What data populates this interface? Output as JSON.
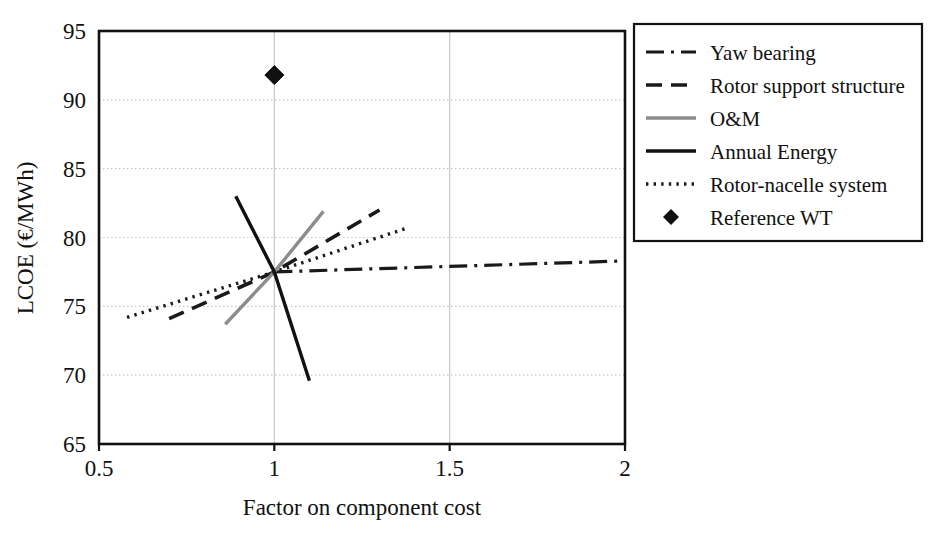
{
  "chart_data": {
    "type": "line",
    "title": "",
    "xlabel": "Factor on component cost",
    "ylabel": "LCOE (€/MWh)",
    "xlim": [
      0.5,
      2.0
    ],
    "ylim": [
      65,
      95
    ],
    "xticks": [
      "0.5",
      "1",
      "1.5",
      "2"
    ],
    "xtick_values": [
      0.5,
      1.0,
      1.5,
      2.0
    ],
    "yticks": [
      "65",
      "70",
      "75",
      "80",
      "85",
      "90",
      "95"
    ],
    "ytick_values": [
      65,
      70,
      75,
      80,
      85,
      90,
      95
    ],
    "grid": true,
    "grid_axis": "y",
    "legend_position": "right",
    "baseline_point": {
      "x": 1.0,
      "y": 77.5
    },
    "series": [
      {
        "name": "Yaw bearing",
        "style": "dash-dot",
        "color": "#1a1a1a",
        "points": [
          [
            1.0,
            77.5
          ],
          [
            2.0,
            78.3
          ]
        ]
      },
      {
        "name": "Rotor support structure",
        "style": "dashed",
        "color": "#1a1a1a",
        "points": [
          [
            0.7,
            74.1
          ],
          [
            1.0,
            77.5
          ],
          [
            1.3,
            82.0
          ]
        ]
      },
      {
        "name": "O&M",
        "style": "solid",
        "color": "#8c8c8c",
        "points": [
          [
            0.86,
            73.7
          ],
          [
            1.0,
            77.5
          ],
          [
            1.14,
            81.9
          ]
        ]
      },
      {
        "name": "Annual Energy",
        "style": "solid",
        "color": "#111111",
        "points": [
          [
            0.89,
            83.0
          ],
          [
            1.0,
            77.5
          ],
          [
            1.1,
            69.6
          ]
        ]
      },
      {
        "name": "Rotor-nacelle system",
        "style": "dotted",
        "color": "#1a1a1a",
        "points": [
          [
            0.58,
            74.2
          ],
          [
            1.0,
            77.5
          ],
          [
            1.38,
            80.7
          ]
        ]
      },
      {
        "name": "Reference WT",
        "style": "marker-diamond",
        "color": "#111111",
        "points": [
          [
            1.0,
            91.8
          ]
        ]
      }
    ]
  },
  "legend": {
    "entries": [
      {
        "label": "Yaw bearing",
        "swatch": "dash-dot-line-swatch"
      },
      {
        "label": "Rotor support structure",
        "swatch": "dashed-line-swatch"
      },
      {
        "label": "O&M",
        "swatch": "gray-solid-line-swatch"
      },
      {
        "label": "Annual Energy",
        "swatch": "black-solid-line-swatch"
      },
      {
        "label": "Rotor-nacelle system",
        "swatch": "dotted-line-swatch"
      },
      {
        "label": "Reference WT",
        "swatch": "diamond-marker-swatch"
      }
    ]
  },
  "colors": {
    "axis": "#111111",
    "grid": "#c8c8c8",
    "gray_series": "#8c8c8c",
    "black_series": "#111111",
    "background": "#ffffff"
  }
}
